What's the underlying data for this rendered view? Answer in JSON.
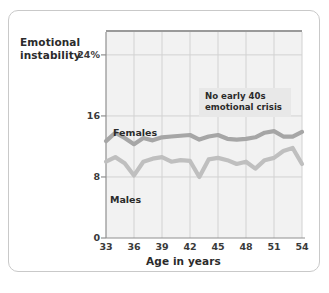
{
  "chart_data": {
    "type": "line",
    "title": "",
    "xlabel": "Age in years",
    "ylabel": "Emotional instability",
    "xlim": [
      33,
      54
    ],
    "ylim": [
      0,
      27
    ],
    "xticks": [
      "33",
      "36",
      "39",
      "42",
      "45",
      "48",
      "51",
      "54"
    ],
    "xtick_values": [
      33,
      36,
      39,
      42,
      45,
      48,
      51,
      54
    ],
    "yticks": [
      "0",
      "8",
      "16",
      "24%"
    ],
    "ytick_values": [
      0,
      8,
      16,
      24
    ],
    "grid": "vertical-and-horizontal",
    "legend_position": "inline-labels",
    "x": [
      33,
      34,
      35,
      36,
      37,
      38,
      39,
      40,
      41,
      42,
      43,
      44,
      45,
      46,
      47,
      48,
      49,
      50,
      51,
      52,
      53,
      54
    ],
    "series": [
      {
        "name": "Females",
        "color": "#a6a6a6",
        "values": [
          12.7,
          13.8,
          13.1,
          12.3,
          13.1,
          12.8,
          13.2,
          13.3,
          13.4,
          13.5,
          12.9,
          13.3,
          13.5,
          13.0,
          12.9,
          13.0,
          13.2,
          13.8,
          14.0,
          13.3,
          13.3,
          13.9
        ]
      },
      {
        "name": "Males",
        "color": "#bfbfbf",
        "values": [
          10.0,
          10.6,
          9.8,
          8.2,
          10.0,
          10.4,
          10.6,
          10.0,
          10.2,
          10.1,
          8.0,
          10.3,
          10.5,
          10.2,
          9.7,
          10.0,
          9.1,
          10.2,
          10.5,
          11.4,
          11.8,
          9.7
        ]
      }
    ],
    "annotations": [
      {
        "lines": [
          "No early 40s",
          "emotional crisis"
        ],
        "background": "#e8e8e8"
      }
    ]
  },
  "colors": {
    "plot_background": "#f2f2f2",
    "gridline": "#d2d2d2",
    "axis": "#8f8f8f",
    "card_border": "#c9c9c9",
    "text": "#2b2b2b"
  }
}
